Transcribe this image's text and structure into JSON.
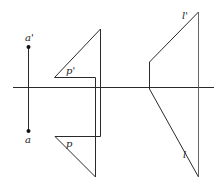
{
  "diagram": {
    "type": "descriptive-geometry projection",
    "labels": {
      "a_prime": "a'",
      "a": "a",
      "p_prime": "p'",
      "p": "p",
      "l_prime": "l'",
      "l": "l"
    },
    "colors": {
      "line": "#2a2a2a",
      "background": "#ffffff"
    }
  }
}
